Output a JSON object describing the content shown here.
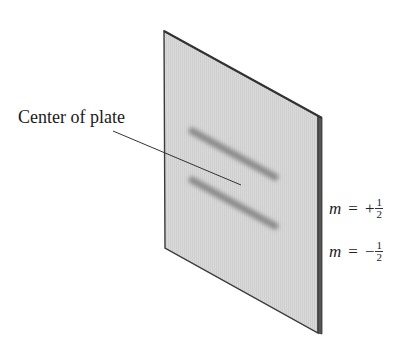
{
  "figure": {
    "plate_label": "Center of plate",
    "beams": [
      {
        "label_var": "m",
        "label_eq": "=",
        "sign": "+",
        "numerator": "1",
        "denominator": "2"
      },
      {
        "label_var": "m",
        "label_eq": "=",
        "sign": "−",
        "numerator": "1",
        "denominator": "2"
      }
    ]
  },
  "colors": {
    "plate_fill": "#d6d6d6",
    "plate_edge": "#3a3a3a",
    "stripe": "#8e8e8e",
    "text": "#1a1a1a"
  }
}
